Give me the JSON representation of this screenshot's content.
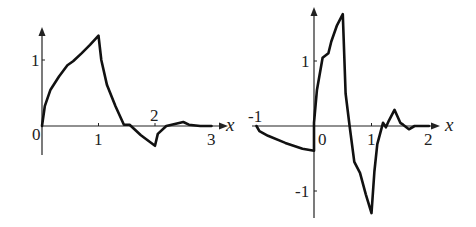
{
  "chart_data": [
    {
      "type": "line",
      "title": "",
      "xlabel": "x",
      "ylabel": "",
      "xlim": [
        0,
        3
      ],
      "ylim": [
        -0.3,
        1.5
      ],
      "grid": false,
      "legend": null,
      "x_ticks": [
        "1",
        "2",
        "3"
      ],
      "y_ticks": [
        "1"
      ],
      "origin_label": "0",
      "series": [
        {
          "name": "curve",
          "x": [
            0,
            0.05,
            0.15,
            0.3,
            0.45,
            0.55,
            0.7,
            0.85,
            1.0,
            1.05,
            1.15,
            1.3,
            1.45,
            1.55,
            1.75,
            2.0,
            2.05,
            2.2,
            2.35,
            2.5,
            2.6,
            2.8,
            3.0
          ],
          "y": [
            0,
            0.3,
            0.55,
            0.75,
            0.92,
            0.98,
            1.1,
            1.23,
            1.37,
            1.0,
            0.62,
            0.3,
            0.02,
            0.02,
            -0.14,
            -0.3,
            -0.12,
            0.0,
            0.03,
            0.06,
            0.02,
            0.0,
            0.0
          ]
        }
      ],
      "annotations": []
    },
    {
      "type": "line",
      "title": "",
      "xlabel": "x",
      "ylabel": "",
      "xlim": [
        -1,
        2
      ],
      "ylim": [
        -1.4,
        1.8
      ],
      "grid": false,
      "legend": null,
      "x_ticks": [
        "-1",
        "0",
        "1",
        "2"
      ],
      "y_ticks": [
        "1",
        "-1"
      ],
      "series": [
        {
          "name": "curve",
          "x": [
            -1.0,
            -0.95,
            -0.8,
            -0.5,
            -0.2,
            0.0,
            0.0,
            0.05,
            0.15,
            0.25,
            0.3,
            0.4,
            0.5,
            0.55,
            0.62,
            0.7,
            0.8,
            0.9,
            1.0,
            1.05,
            1.1,
            1.2,
            1.25,
            1.3,
            1.4,
            1.5,
            1.55,
            1.65,
            1.75,
            1.85,
            2.0
          ],
          "y": [
            0.0,
            -0.08,
            -0.15,
            -0.26,
            -0.35,
            -0.38,
            0.05,
            0.55,
            1.05,
            1.12,
            1.3,
            1.55,
            1.72,
            0.5,
            0.0,
            -0.55,
            -0.72,
            -1.05,
            -1.34,
            -0.7,
            -0.28,
            0.05,
            -0.02,
            0.08,
            0.25,
            0.05,
            0.02,
            -0.05,
            0.0,
            0.0,
            0.0
          ]
        }
      ],
      "annotations": []
    }
  ],
  "plots": [
    {
      "origin_px": [
        42,
        126
      ],
      "unit_px": [
        56.5,
        66
      ],
      "axis_x_end": 226,
      "axis_y_top": 28,
      "axis_y_bottom": 153,
      "labels": {
        "origin": "0",
        "x1": "1",
        "x2": "2",
        "x3": "3",
        "y1": "1",
        "axis": "x"
      }
    },
    {
      "origin_px": [
        314,
        126
      ],
      "unit_px": [
        57.5,
        65
      ],
      "axis_x_start": 252,
      "axis_x_end": 438,
      "axis_y_top": 8,
      "axis_y_bottom": 216,
      "labels": {
        "xm1": "-1",
        "origin": "0",
        "x1": "1",
        "x2": "2",
        "y1": "1",
        "ym1": "-1",
        "axis": "x"
      }
    }
  ]
}
